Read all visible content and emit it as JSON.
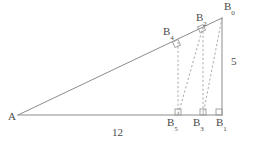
{
  "figure": {
    "type": "geometric-diagram",
    "stroke_color": "#8c8c8c",
    "dash_color": "#a8a8a8",
    "label_color": "#4a4a4a",
    "background": "#ffffff"
  },
  "vertices": {
    "A": {
      "label": "A",
      "sub": "",
      "x": 18,
      "y": 115,
      "lx": 8,
      "ly": 117
    },
    "B0": {
      "label": "B",
      "sub": "0",
      "x": 222,
      "y": 18,
      "lx": 224,
      "ly": 4
    },
    "B1": {
      "label": "B",
      "sub": "1",
      "x": 222,
      "y": 115,
      "lx": 216,
      "ly": 120
    },
    "B2": {
      "label": "B",
      "sub": "2",
      "x": 203,
      "y": 27,
      "lx": 196,
      "ly": 15
    },
    "B3": {
      "label": "B",
      "sub": "3",
      "x": 203,
      "y": 115,
      "lx": 193,
      "ly": 120
    },
    "B4": {
      "label": "B",
      "sub": "4",
      "x": 178,
      "y": 42,
      "lx": 163,
      "ly": 29
    },
    "B5": {
      "label": "B",
      "sub": "5",
      "x": 178,
      "y": 115,
      "lx": 167,
      "ly": 120
    }
  },
  "side_labels": {
    "base": {
      "text": "12",
      "x": 112,
      "y": 131
    },
    "right": {
      "text": "5",
      "x": 231,
      "y": 61
    }
  },
  "segments": {
    "solid": [
      {
        "name": "hypotenuse-A-B0",
        "x1": 18,
        "y1": 115,
        "x2": 222,
        "y2": 18
      },
      {
        "name": "base-A-B1",
        "x1": 18,
        "y1": 115,
        "x2": 222,
        "y2": 115
      },
      {
        "name": "vertical-B0-B1",
        "x1": 222,
        "y1": 18,
        "x2": 222,
        "y2": 115
      }
    ],
    "dashed": [
      {
        "name": "perpendicular-B0-B1-foot",
        "x1": 222,
        "y1": 18,
        "x2": 203,
        "y2": 115
      },
      {
        "name": "vertical-B2-B3",
        "x1": 203,
        "y1": 27,
        "x2": 203,
        "y2": 115
      },
      {
        "name": "perpendicular-B2-B3",
        "x1": 203,
        "y1": 27,
        "x2": 178,
        "y2": 115
      },
      {
        "name": "vertical-B4-B5",
        "x1": 178,
        "y1": 42,
        "x2": 178,
        "y2": 115
      }
    ]
  },
  "right_angle_marks": [
    {
      "name": "right-angle-B1",
      "x": 222,
      "y": 115,
      "dir": "bottom-right"
    },
    {
      "name": "right-angle-B3",
      "x": 203,
      "y": 115,
      "dir": "bottom-mid"
    },
    {
      "name": "right-angle-B5",
      "x": 178,
      "y": 115,
      "dir": "bottom-left"
    },
    {
      "name": "right-angle-B2",
      "x": 203,
      "y": 27,
      "dir": "hyp"
    },
    {
      "name": "right-angle-B4",
      "x": 178,
      "y": 42,
      "dir": "hyp"
    }
  ]
}
